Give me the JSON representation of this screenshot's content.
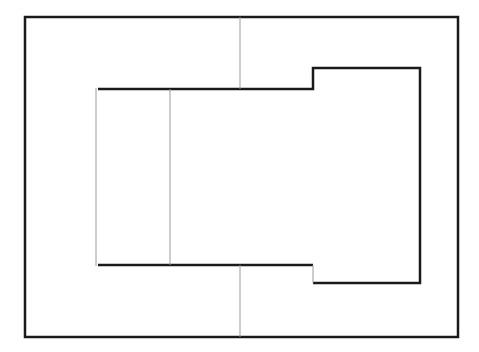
{
  "diagram": {
    "type": "floor-plan-outline",
    "background": "#ffffff",
    "colors": {
      "thick": "#1a1a1a",
      "thin": "#9a9a9a"
    },
    "outer_rect": {
      "x": 25,
      "y": 17,
      "w": 433,
      "h": 320
    },
    "inner_path": "M 98 89 L 313 89 L 313 68 L 420 68 L 420 283 L 313 283",
    "inner_bottom": "M 313 265 L 98 265",
    "thin_lines": [
      {
        "name": "inner-left-wall",
        "x1": 96,
        "y1": 88,
        "x2": 96,
        "y2": 266
      },
      {
        "name": "inner-divider",
        "x1": 170,
        "y1": 89,
        "x2": 170,
        "y2": 265
      },
      {
        "name": "top-connector",
        "x1": 240,
        "y1": 17,
        "x2": 240,
        "y2": 89
      },
      {
        "name": "bottom-connector",
        "x1": 240,
        "y1": 265,
        "x2": 240,
        "y2": 337
      },
      {
        "name": "step-bottom-side",
        "x1": 313,
        "y1": 265,
        "x2": 313,
        "y2": 283
      }
    ]
  }
}
